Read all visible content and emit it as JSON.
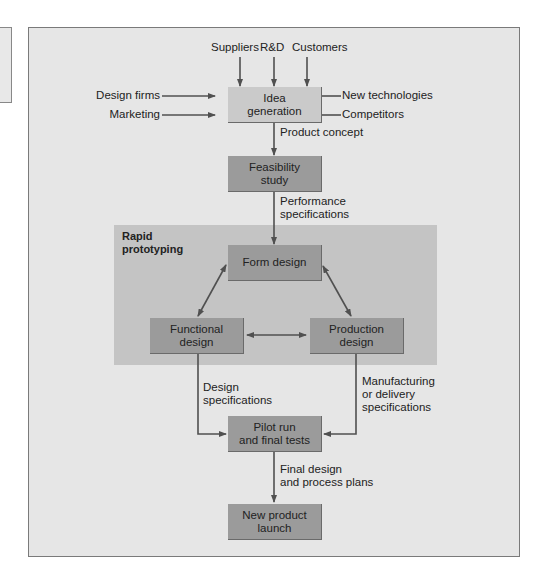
{
  "diagram": {
    "colors": {
      "background": "#e6e6e6",
      "region": "#c4c4c4",
      "box": "#9b9b9b",
      "box_light": "#cacaca",
      "arrow": "#505050"
    },
    "inputs_top": [
      "Suppliers",
      "R&D",
      "Customers"
    ],
    "inputs_left": [
      "Design firms",
      "Marketing"
    ],
    "inputs_right": [
      "New technologies",
      "Competitors"
    ],
    "nodes": {
      "idea": "Idea\ngeneration",
      "feasibility": "Feasibility\nstudy",
      "form": "Form design",
      "functional": "Functional\ndesign",
      "production": "Production\ndesign",
      "pilot": "Pilot run\nand final tests",
      "launch": "New product\nlaunch"
    },
    "region_label": "Rapid\nprototyping",
    "edge_labels": {
      "product_concept": "Product concept",
      "performance_specs": "Performance\nspecifications",
      "design_specs": "Design\nspecifications",
      "manufacturing_specs": "Manufacturing\nor delivery\nspecifications",
      "final_design": "Final design\nand process plans"
    }
  }
}
